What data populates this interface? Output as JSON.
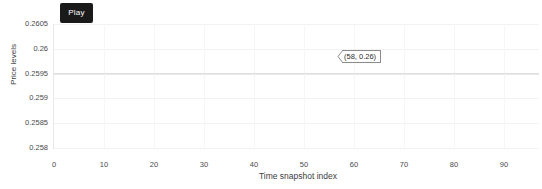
{
  "controls": {
    "play_label": "Play"
  },
  "chart_data": {
    "type": "line",
    "title": "",
    "xlabel": "Time snapshot index",
    "ylabel": "Price levels",
    "xlim": [
      0,
      97
    ],
    "ylim": [
      0.258,
      0.2605
    ],
    "grid": true,
    "legend": "none",
    "x_ticks": [
      0,
      10,
      20,
      30,
      40,
      50,
      60,
      70,
      80,
      90
    ],
    "x_tick_labels": [
      "0",
      "10",
      "20",
      "30",
      "40",
      "50",
      "60",
      "70",
      "80",
      "90"
    ],
    "y_ticks": [
      0.2605,
      0.26,
      0.2595,
      0.259,
      0.2585,
      0.258
    ],
    "y_tick_labels": [
      "0.2605",
      "0.26",
      "0.2595",
      "0.259",
      "0.2585",
      "0.258"
    ],
    "series": [
      {
        "name": "price",
        "x": [
          0,
          10,
          20,
          30,
          40,
          50,
          58,
          60,
          70,
          80,
          90,
          97
        ],
        "values": [
          0.2595,
          0.2595,
          0.2595,
          0.2595,
          0.2595,
          0.2595,
          0.2595,
          0.2595,
          0.2595,
          0.2595,
          0.2595,
          0.2595
        ]
      }
    ],
    "annotations": [
      {
        "label": "(58, 0.26)",
        "x": 58,
        "y": 0.26,
        "arrow": "left"
      }
    ]
  },
  "annotation": {
    "text": "(58, 0.26)"
  },
  "colors": {
    "button_bg": "#1a1a1a",
    "button_fg": "#ffffff",
    "grid": "#f2f2f2",
    "axis": "#e3e3e3",
    "text": "#4a4a4a",
    "tooltip_border": "#8c8c8c",
    "background": "#ffffff"
  }
}
